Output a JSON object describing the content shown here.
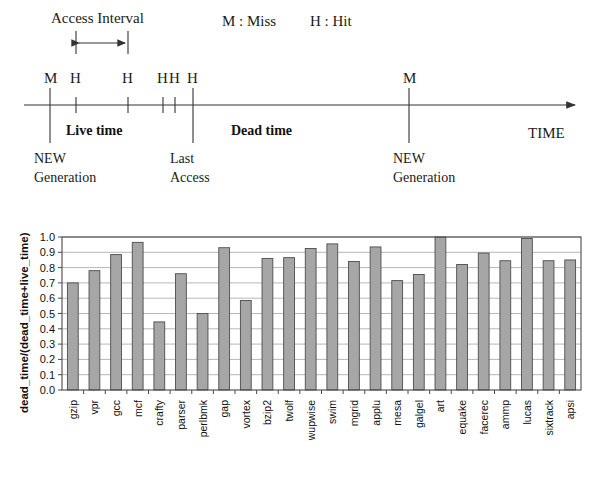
{
  "figure": {
    "timeline": {
      "access_interval_label": "Access Interval",
      "legend_miss": "M : Miss",
      "legend_hit": "H : Hit",
      "axis_label": "TIME",
      "live_time_label": "Live time",
      "dead_time_label": "Dead time",
      "events": [
        {
          "mark": "M",
          "x": 50
        },
        {
          "mark": "H",
          "x": 76
        },
        {
          "mark": "H",
          "x": 128
        },
        {
          "mark": "H",
          "x": 163
        },
        {
          "mark": "H",
          "x": 175
        },
        {
          "mark": "H",
          "x": 193
        },
        {
          "mark": "M",
          "x": 409
        }
      ],
      "annotations": [
        {
          "line1": "NEW",
          "line2": "Generation",
          "x": 34
        },
        {
          "line1": "Last",
          "line2": "Access",
          "x": 170
        },
        {
          "line1": "NEW",
          "line2": "Generation",
          "x": 393
        }
      ]
    }
  },
  "chart_data": {
    "type": "bar",
    "title": "",
    "xlabel": "",
    "ylabel": "dead_time/(dead_time+live_time)",
    "ylim": [
      0.0,
      1.0
    ],
    "grid": true,
    "legend": "none",
    "ytick_labels": [
      "1.0",
      "0.9",
      "0.8",
      "0.7",
      "0.6",
      "0.5",
      "0.4",
      "0.3",
      "0.2",
      "0.1",
      "0.0"
    ],
    "ytick_values": [
      1.0,
      0.9,
      0.8,
      0.7,
      0.6,
      0.5,
      0.4,
      0.3,
      0.2,
      0.1,
      0.0
    ],
    "categories": [
      "gzip",
      "vpr",
      "gcc",
      "mcf",
      "crafty",
      "parser",
      "perlbmk",
      "gap",
      "vortex",
      "bzip2",
      "twolf",
      "wupwise",
      "swim",
      "mgrid",
      "applu",
      "mesa",
      "galgel",
      "art",
      "equake",
      "facerec",
      "ammp",
      "lucas",
      "sixtrack",
      "apsi"
    ],
    "values": [
      0.7,
      0.78,
      0.885,
      0.965,
      0.445,
      0.76,
      0.5,
      0.93,
      0.585,
      0.86,
      0.865,
      0.925,
      0.955,
      0.84,
      0.935,
      0.715,
      0.755,
      1.0,
      0.82,
      0.895,
      0.845,
      0.99,
      0.845,
      0.85
    ]
  }
}
